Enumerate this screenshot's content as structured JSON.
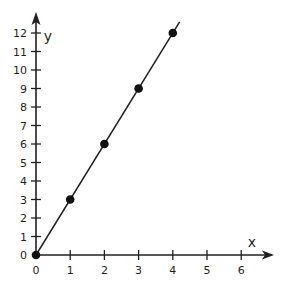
{
  "chart_data": {
    "type": "line",
    "title": "",
    "xlabel": "x",
    "ylabel": "y",
    "xlim": [
      0,
      6
    ],
    "ylim": [
      0,
      12
    ],
    "x_ticks": [
      0,
      1,
      2,
      3,
      4,
      5,
      6
    ],
    "y_ticks": [
      0,
      1,
      2,
      3,
      4,
      5,
      6,
      7,
      8,
      9,
      10,
      11,
      12
    ],
    "grid": false,
    "legend": "none",
    "series": [
      {
        "name": "y = 3x",
        "x": [
          0,
          1,
          2,
          3,
          4
        ],
        "y": [
          0,
          3,
          6,
          9,
          12
        ],
        "line_extends_to_x": 4.2,
        "color": "#231f20"
      }
    ]
  }
}
